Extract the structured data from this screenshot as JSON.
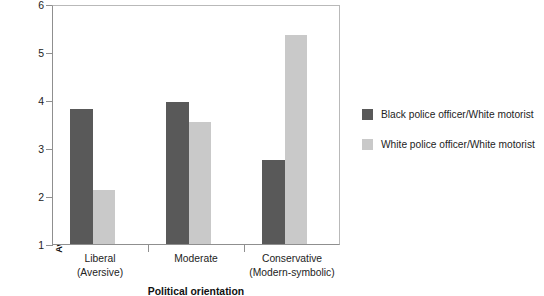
{
  "chart_data": {
    "type": "bar",
    "title": "",
    "xlabel": "Political orientation",
    "ylabel": "Average rating of extent to which officer was exposed to double jeopardy",
    "categories": [
      "Liberal (Aversive)",
      "Moderate",
      "Conservative (Modern-symbolic)"
    ],
    "category_lines": [
      [
        "Liberal",
        "(Aversive)"
      ],
      [
        "Moderate",
        ""
      ],
      [
        "Conservative",
        "(Modern-symbolic)"
      ]
    ],
    "series": [
      {
        "name": "Black police officer/White motorist",
        "color": "#595959",
        "values": [
          3.82,
          3.95,
          2.75
        ]
      },
      {
        "name": "White police officer/White motorist",
        "color": "#c9c9c9",
        "values": [
          2.12,
          3.55,
          5.35
        ]
      }
    ],
    "ylim": [
      1,
      6
    ],
    "yticks": [
      1,
      2,
      3,
      4,
      5,
      6
    ],
    "ytick_labels": [
      "1",
      "2",
      "3",
      "4",
      "5",
      "6"
    ],
    "grid": false,
    "legend_position": "right"
  },
  "legend": {
    "entries": [
      {
        "label": "Black police officer/White motorist",
        "swatch": "dark"
      },
      {
        "label": "White police officer/White motorist",
        "swatch": "light"
      }
    ]
  }
}
